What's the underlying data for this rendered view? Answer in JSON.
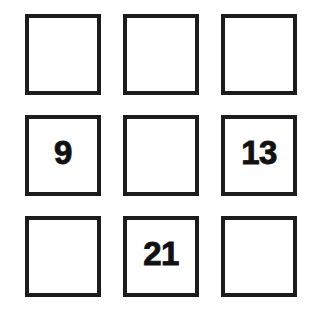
{
  "grid": {
    "rows": 3,
    "columns": 3,
    "background_color": "#ffffff",
    "border_color": "#1c1c1c",
    "text_color": "#111111",
    "cells": [
      {
        "id": "r1c1",
        "value": "",
        "filled": false
      },
      {
        "id": "r1c2",
        "value": "",
        "filled": false
      },
      {
        "id": "r1c3",
        "value": "",
        "filled": false
      },
      {
        "id": "r2c1",
        "value": "9",
        "filled": true
      },
      {
        "id": "r2c2",
        "value": "",
        "filled": false
      },
      {
        "id": "r2c3",
        "value": "13",
        "filled": true
      },
      {
        "id": "r3c1",
        "value": "",
        "filled": false
      },
      {
        "id": "r3c2",
        "value": "21",
        "filled": true
      },
      {
        "id": "r3c3",
        "value": "",
        "filled": false
      }
    ]
  }
}
